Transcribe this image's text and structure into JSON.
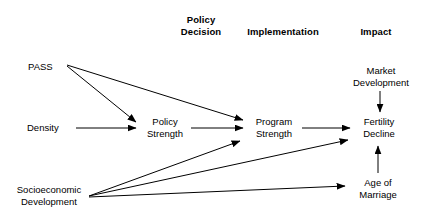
{
  "diagram": {
    "type": "path-diagram",
    "background_color": "#ffffff",
    "line_color": "#000000",
    "text_color": "#000000",
    "canvas": {
      "width": 424,
      "height": 222
    },
    "column_headers": [
      {
        "id": "policy-decision",
        "label": "Policy\nDecision",
        "x": 166,
        "y": 14,
        "width": 70
      },
      {
        "id": "implementation",
        "label": "Implementation",
        "x": 228,
        "y": 26,
        "width": 110
      },
      {
        "id": "impact",
        "label": "Impact",
        "x": 345,
        "y": 26,
        "width": 62
      }
    ],
    "nodes": [
      {
        "id": "pass",
        "label": "PASS",
        "x": 28,
        "y": 61,
        "width": 36,
        "align": "left"
      },
      {
        "id": "density",
        "label": "Density",
        "x": 27,
        "y": 122,
        "width": 46,
        "align": "left"
      },
      {
        "id": "socioeconomic-development",
        "label": "Socioeconomic\nDevelopment",
        "x": 12,
        "y": 184,
        "width": 74,
        "align": "center"
      },
      {
        "id": "policy-strength",
        "label": "Policy\nStrength",
        "x": 143,
        "y": 116,
        "width": 44,
        "align": "center"
      },
      {
        "id": "program-strength",
        "label": "Program\nStrength",
        "x": 249,
        "y": 116,
        "width": 50,
        "align": "center"
      },
      {
        "id": "market-development",
        "label": "Market\nDevelopment",
        "x": 345,
        "y": 65,
        "width": 72,
        "align": "center"
      },
      {
        "id": "fertility-decline",
        "label": "Fertility\nDecline",
        "x": 355,
        "y": 116,
        "width": 48,
        "align": "center"
      },
      {
        "id": "age-of-marriage",
        "label": "Age of\nMarriage",
        "x": 352,
        "y": 177,
        "width": 52,
        "align": "center"
      }
    ],
    "edges": [
      {
        "id": "pass-to-policy-strength",
        "from": "pass",
        "to": "policy-strength",
        "x1": 67,
        "y1": 66,
        "x2": 136,
        "y2": 122
      },
      {
        "id": "pass-to-program-strength",
        "from": "pass",
        "to": "program-strength",
        "x1": 67,
        "y1": 65,
        "x2": 243,
        "y2": 120
      },
      {
        "id": "density-to-policy-strength",
        "from": "density",
        "to": "policy-strength",
        "x1": 76,
        "y1": 128,
        "x2": 136,
        "y2": 128
      },
      {
        "id": "policy-strength-to-program-strength",
        "from": "policy-strength",
        "to": "program-strength",
        "x1": 191,
        "y1": 128,
        "x2": 243,
        "y2": 128
      },
      {
        "id": "program-strength-to-fertility-decline",
        "from": "program-strength",
        "to": "fertility-decline",
        "x1": 302,
        "y1": 128,
        "x2": 350,
        "y2": 128
      },
      {
        "id": "market-development-to-fertility-decline",
        "from": "market-development",
        "to": "fertility-decline",
        "x1": 380,
        "y1": 91,
        "x2": 380,
        "y2": 112
      },
      {
        "id": "age-of-marriage-to-fertility-decline",
        "from": "age-of-marriage",
        "to": "fertility-decline",
        "x1": 378,
        "y1": 173,
        "x2": 378,
        "y2": 146
      },
      {
        "id": "socioeconomic-to-program-strength",
        "from": "socioeconomic-development",
        "to": "program-strength",
        "x1": 89,
        "y1": 196,
        "x2": 240,
        "y2": 141
      },
      {
        "id": "socioeconomic-to-fertility-decline",
        "from": "socioeconomic-development",
        "to": "fertility-decline",
        "x1": 89,
        "y1": 196,
        "x2": 348,
        "y2": 140
      },
      {
        "id": "socioeconomic-to-age-of-marriage",
        "from": "socioeconomic-development",
        "to": "age-of-marriage",
        "x1": 89,
        "y1": 197,
        "x2": 345,
        "y2": 186
      }
    ]
  }
}
